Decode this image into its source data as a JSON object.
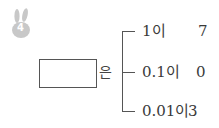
{
  "problem": {
    "number": "4",
    "icon": "bunny-icon",
    "icon_color": "#c8c8c8",
    "particle": "은",
    "rows": [
      {
        "place": "1이",
        "value": "7"
      },
      {
        "place": "0.1이",
        "value": "0"
      },
      {
        "place": "0.01이",
        "value": "3"
      }
    ]
  }
}
